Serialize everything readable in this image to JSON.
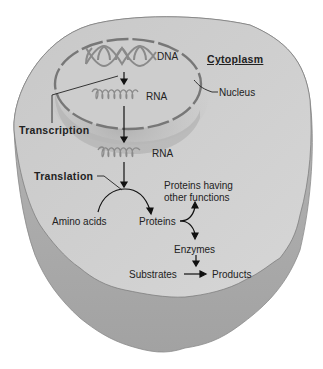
{
  "diagram": {
    "regions": {
      "cytoplasm": "Cytoplasm",
      "nucleus": "Nucleus"
    },
    "molecules": {
      "dna": "DNA",
      "rna_nuclear": "RNA",
      "rna_cytoplasmic": "RNA",
      "amino_acids": "Amino acids",
      "proteins": "Proteins",
      "proteins_other": "Proteins having other functions",
      "proteins_other_line1": "Proteins having",
      "proteins_other_line2": "other functions",
      "enzymes": "Enzymes",
      "substrates": "Substrates",
      "products": "Products"
    },
    "processes": {
      "transcription": "Transcription",
      "translation": "Translation"
    },
    "colors": {
      "cell_top": "#cfcfcf",
      "cell_side": "#a9a9a9",
      "nucleus_envelope": "#777777",
      "helix": "#888888",
      "text": "#222222"
    }
  }
}
